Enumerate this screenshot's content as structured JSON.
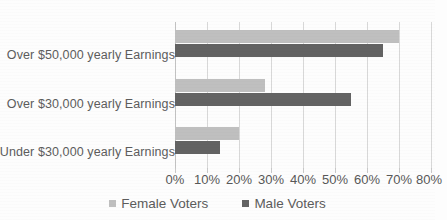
{
  "chart_data": {
    "type": "bar",
    "orientation": "horizontal",
    "title": "",
    "subtitle": "",
    "xlabel": "",
    "ylabel": "",
    "categories": [
      "Over $50,000 yearly Earnings",
      "Over $30,000 yearly Earnings",
      "Under $30,000 yearly Earnings"
    ],
    "series": [
      {
        "name": "Female Voters",
        "color": "#bfbfbf",
        "values": [
          70,
          28,
          20
        ]
      },
      {
        "name": "Male Voters",
        "color": "#636363",
        "values": [
          65,
          55,
          14
        ]
      }
    ],
    "xlim": [
      0,
      80
    ],
    "xtick_labels": [
      "0%",
      "10%",
      "20%",
      "30%",
      "40%",
      "50%",
      "60%",
      "70%",
      "80%"
    ],
    "xtick_values": [
      0,
      10,
      20,
      30,
      40,
      50,
      60,
      70,
      80
    ],
    "grid": true,
    "grid_axis": "x",
    "legend_position": "bottom",
    "value_unit": "%"
  },
  "legend": {
    "items": [
      {
        "label": "Female Voters",
        "color": "#bfbfbf"
      },
      {
        "label": "Male Voters",
        "color": "#636363"
      }
    ]
  },
  "colors": {
    "female": "#bfbfbf",
    "male": "#636363",
    "gridline": "#d8d8d8",
    "axis": "#c2c2c2",
    "text": "#5c5c5c",
    "background": "#fdfdfd"
  }
}
